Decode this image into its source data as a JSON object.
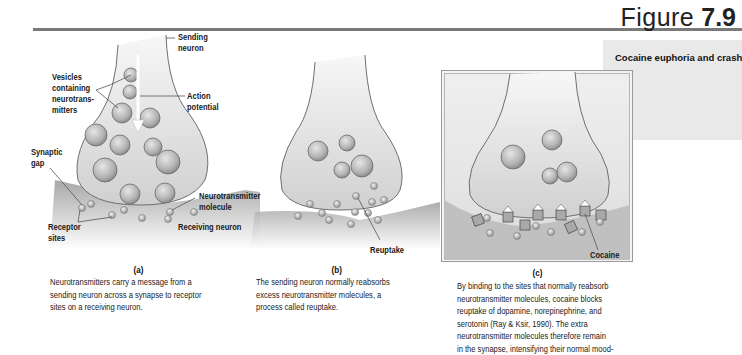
{
  "header": {
    "figure_word": "Figure",
    "figure_number": "7.9"
  },
  "side_panel": {
    "title": "Cocaine euphoria and crash"
  },
  "panel_a": {
    "sub_label": "(a)",
    "labels": {
      "sending_neuron": [
        "Sending",
        "neuron"
      ],
      "vesicles": [
        "Vesicles",
        "containing",
        "neurotrans-",
        "mitters"
      ],
      "action_potential": [
        "Action",
        "potential"
      ],
      "synaptic_gap": [
        "Synaptic",
        "gap"
      ],
      "neurotransmitter_molecule": [
        "Neurotransmitter",
        "molecule"
      ],
      "receptor_sites": [
        "Receptor",
        "sites"
      ],
      "receiving_neuron": "Receiving neuron"
    },
    "caption": [
      "Neurotransmitters carry a message from a",
      "sending neuron across a synapse to receptor",
      "sites on a receiving neuron."
    ]
  },
  "panel_b": {
    "sub_label": "(b)",
    "labels": {
      "reuptake": "Reuptake"
    },
    "caption": [
      "The sending neuron normally reabsorbs",
      "excess neurotransmitter molecules, a",
      "process called reuptake."
    ]
  },
  "panel_c": {
    "sub_label": "(c)",
    "labels": {
      "cocaine": "Cocaine"
    },
    "caption": [
      "By binding to the sites that normally reabsorb",
      "neurotransmitter molecules, cocaine blocks",
      "reuptake of dopamine, norepinephrine, and",
      "serotonin (Ray & Ksir, 1990). The extra",
      "neurotransmitter molecules therefore remain",
      "in the synapse, intensifying their normal mood-"
    ]
  },
  "colors": {
    "rule": "#7a7a7a",
    "side_panel_bg": "#e9e9e9",
    "neuron_fill": "#dcdcdc",
    "neuron_outline": "#6f6f6f",
    "vesicle_fill": "#bdbdbd",
    "receiving_neuron": "#a9a9a9"
  }
}
